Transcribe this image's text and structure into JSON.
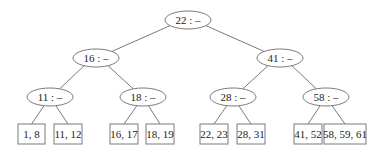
{
  "diagram": {
    "type": "tree",
    "internal_nodes": [
      {
        "id": "n22",
        "label": "22 : –",
        "cx": 188,
        "cy": 20,
        "rx": 23,
        "ry": 9
      },
      {
        "id": "n16",
        "label": "16 : –",
        "cx": 96,
        "cy": 58,
        "rx": 23,
        "ry": 9
      },
      {
        "id": "n41",
        "label": "41 : –",
        "cx": 280,
        "cy": 58,
        "rx": 23,
        "ry": 9
      },
      {
        "id": "n11",
        "label": "11 : –",
        "cx": 50,
        "cy": 97,
        "rx": 23,
        "ry": 9
      },
      {
        "id": "n18",
        "label": "18 : –",
        "cx": 143,
        "cy": 97,
        "rx": 23,
        "ry": 9
      },
      {
        "id": "n28",
        "label": "28 : –",
        "cx": 233,
        "cy": 97,
        "rx": 23,
        "ry": 9
      },
      {
        "id": "n58",
        "label": "58 : –",
        "cx": 326,
        "cy": 97,
        "rx": 23,
        "ry": 9
      }
    ],
    "leaves": [
      {
        "id": "l1",
        "label": "1, 8",
        "x": 18,
        "y": 124,
        "w": 27,
        "h": 20
      },
      {
        "id": "l2",
        "label": "11, 12",
        "x": 54,
        "y": 124,
        "w": 28,
        "h": 20
      },
      {
        "id": "l3",
        "label": "16, 17",
        "x": 110,
        "y": 124,
        "w": 28,
        "h": 20
      },
      {
        "id": "l4",
        "label": "18, 19",
        "x": 146,
        "y": 124,
        "w": 28,
        "h": 20
      },
      {
        "id": "l5",
        "label": "22, 23",
        "x": 200,
        "y": 124,
        "w": 28,
        "h": 20
      },
      {
        "id": "l6",
        "label": "28, 31",
        "x": 237,
        "y": 124,
        "w": 28,
        "h": 20
      },
      {
        "id": "l7",
        "label": "41, 52",
        "x": 294,
        "y": 124,
        "w": 28,
        "h": 20
      },
      {
        "id": "l8",
        "label": "58, 59, 61",
        "x": 324,
        "y": 124,
        "w": 42,
        "h": 20
      }
    ],
    "edges": [
      {
        "from": "n22",
        "to": "n16"
      },
      {
        "from": "n22",
        "to": "n41"
      },
      {
        "from": "n16",
        "to": "n11"
      },
      {
        "from": "n16",
        "to": "n18"
      },
      {
        "from": "n41",
        "to": "n28"
      },
      {
        "from": "n41",
        "to": "n58"
      },
      {
        "from": "n11",
        "to": "l1"
      },
      {
        "from": "n11",
        "to": "l2"
      },
      {
        "from": "n18",
        "to": "l3"
      },
      {
        "from": "n18",
        "to": "l4"
      },
      {
        "from": "n28",
        "to": "l5"
      },
      {
        "from": "n28",
        "to": "l6"
      },
      {
        "from": "n58",
        "to": "l7"
      },
      {
        "from": "n58",
        "to": "l8"
      }
    ]
  }
}
